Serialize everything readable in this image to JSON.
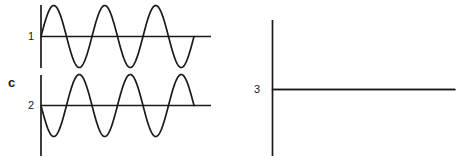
{
  "figure": {
    "group_label": "c",
    "background_color": "#ffffff",
    "ink_color": "#1a1a1a",
    "width": 461,
    "height": 162
  },
  "traces": [
    {
      "label": "1",
      "kind": "sine",
      "phase_deg": 0,
      "cycles": 3,
      "description": "in-phase sinusoid, positive half-cycle first"
    },
    {
      "label": "2",
      "kind": "sine",
      "phase_deg": 180,
      "cycles": 3,
      "description": "inverted sinusoid, negative half-cycle first"
    },
    {
      "label": "3",
      "kind": "flat",
      "phase_deg": 0,
      "cycles": 0,
      "description": "flat null trace, no deflection"
    }
  ],
  "chart_data": {
    "type": "line",
    "title": "",
    "xlabel": "",
    "ylabel": "",
    "grid": false,
    "legend": "none",
    "xlim": [
      0,
      3
    ],
    "ylim": [
      -1,
      1
    ],
    "series": [
      {
        "name": "1",
        "waveform": "sin",
        "amplitude": 1,
        "cycles": 3,
        "phase_deg": 0,
        "values": [
          0,
          0.71,
          1,
          0.71,
          0,
          -0.71,
          -1,
          -0.71,
          0,
          0.71,
          1,
          0.71,
          0,
          -0.71,
          -1,
          -0.71,
          0,
          0.71,
          1,
          0.71,
          0
        ]
      },
      {
        "name": "2",
        "waveform": "-sin",
        "amplitude": 1,
        "cycles": 3,
        "phase_deg": 180,
        "values": [
          0,
          -0.71,
          -1,
          -0.71,
          0,
          0.71,
          1,
          0.71,
          0,
          -0.71,
          -1,
          -0.71,
          0,
          0.71,
          1,
          0.71,
          0,
          -0.71,
          -1,
          -0.71,
          0
        ]
      },
      {
        "name": "3",
        "waveform": "zero",
        "amplitude": 0,
        "cycles": 0,
        "phase_deg": 0,
        "values": [
          0,
          0,
          0,
          0,
          0,
          0,
          0,
          0,
          0,
          0,
          0,
          0,
          0,
          0,
          0,
          0,
          0,
          0,
          0,
          0,
          0
        ]
      }
    ]
  }
}
